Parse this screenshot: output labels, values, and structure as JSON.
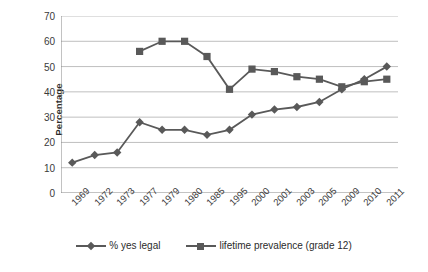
{
  "chart_data": {
    "type": "line",
    "title": "",
    "xlabel": "",
    "ylabel": "Percentage",
    "ylim": [
      0,
      70
    ],
    "ytick_step": 10,
    "yticks": [
      70,
      60,
      50,
      40,
      30,
      20,
      10,
      0
    ],
    "grid": true,
    "legend_position": "bottom",
    "categories": [
      "1969",
      "1972",
      "1973",
      "1977",
      "1979",
      "1980",
      "1985",
      "1995",
      "2000",
      "2001",
      "2003",
      "2005",
      "2009",
      "2010",
      "2011"
    ],
    "series": [
      {
        "name": "% yes legal",
        "marker": "diamond",
        "color": "#595959",
        "values": [
          12,
          15,
          16,
          28,
          25,
          25,
          23,
          25,
          31,
          33,
          34,
          36,
          41,
          45,
          50
        ]
      },
      {
        "name": "lifetime prevalence (grade 12)",
        "marker": "square",
        "color": "#595959",
        "values": [
          null,
          null,
          null,
          56,
          60,
          60,
          54,
          41,
          49,
          48,
          46,
          45,
          42,
          44,
          45
        ]
      }
    ]
  },
  "axis": {
    "y_title": "Percentage"
  },
  "legend": {
    "items": [
      {
        "label": "% yes legal"
      },
      {
        "label": "lifetime prevalence (grade 12)"
      }
    ]
  },
  "style": {
    "series_color": "#595959",
    "grid_color": "#bfbfbf",
    "axis_color": "#868686",
    "text_color": "#2b2b2b",
    "background": "#ffffff"
  }
}
